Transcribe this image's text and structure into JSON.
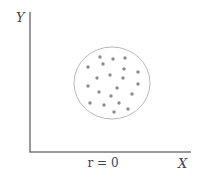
{
  "diagram": {
    "title": "",
    "y_axis_label": "Y",
    "x_axis_label": "X",
    "caption": "r = 0",
    "colors": {
      "axis": "#777777",
      "circle": "#b0b0b0",
      "dot": "#8c8c8c",
      "text": "#444444"
    }
  },
  "chart_data": {
    "type": "scatter",
    "title": "",
    "xlabel": "X",
    "ylabel": "Y",
    "annotation": "r = 0",
    "grid": false,
    "points_px": [
      [
        100,
        57
      ],
      [
        113,
        59
      ],
      [
        125,
        58
      ],
      [
        88,
        67
      ],
      [
        103,
        64
      ],
      [
        124,
        69
      ],
      [
        138,
        72
      ],
      [
        97,
        78
      ],
      [
        110,
        75
      ],
      [
        123,
        78
      ],
      [
        88,
        86
      ],
      [
        117,
        88
      ],
      [
        138,
        84
      ],
      [
        99,
        92
      ],
      [
        111,
        96
      ],
      [
        132,
        94
      ],
      [
        90,
        103
      ],
      [
        104,
        105
      ],
      [
        119,
        103
      ],
      [
        128,
        109
      ],
      [
        114,
        112
      ]
    ],
    "enclosing_circle_px": {
      "cx": 112,
      "cy": 83,
      "rx": 38,
      "ry": 36
    }
  }
}
